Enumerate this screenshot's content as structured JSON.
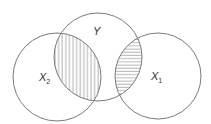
{
  "diagram": {
    "type": "venn",
    "colors": {
      "stroke": "#7a7a7a",
      "hatch": "#9a9a9a",
      "label": "#333333",
      "background": "#ffffff"
    },
    "sets": [
      {
        "id": "Y",
        "label_main": "Y",
        "label_sub": "",
        "cx": 98,
        "cy": 57,
        "r": 44
      },
      {
        "id": "X2",
        "label_main": "X",
        "label_sub": "2",
        "cx": 57,
        "cy": 77,
        "r": 44
      },
      {
        "id": "X1",
        "label_main": "X",
        "label_sub": "1",
        "cx": 158,
        "cy": 76,
        "r": 43
      }
    ],
    "shaded_regions": [
      {
        "between": [
          "Y",
          "X2"
        ],
        "hatch": "vertical"
      },
      {
        "between": [
          "Y",
          "X1"
        ],
        "hatch": "horizontal"
      }
    ]
  }
}
